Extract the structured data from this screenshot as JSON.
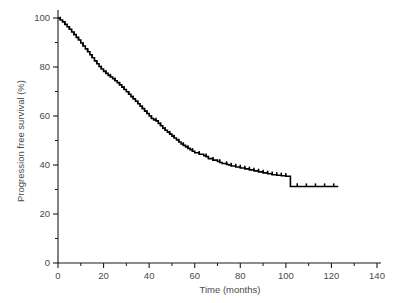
{
  "chart_data": {
    "type": "line",
    "title": "",
    "subtitle": "",
    "xlabel": "Time (months)",
    "ylabel": "Progression free survival (%)",
    "xlim": [
      0,
      140
    ],
    "ylim": [
      0,
      100
    ],
    "xticks": [
      0,
      20,
      40,
      60,
      80,
      100,
      120,
      140
    ],
    "yticks": [
      0,
      20,
      40,
      60,
      80,
      100
    ],
    "xticks_minor": [
      10,
      30,
      50,
      70,
      90,
      110,
      130
    ],
    "yticks_minor": [
      10,
      30,
      50,
      70,
      90
    ],
    "grid": false,
    "legend": "none",
    "annotations": [],
    "series": [
      {
        "name": "Progression free survival",
        "style": "kaplan-meier-step",
        "color": "#000000",
        "x": [
          0,
          1,
          2,
          3,
          4,
          5,
          6,
          7,
          8,
          9,
          10,
          11,
          12,
          13,
          14,
          15,
          16,
          17,
          18,
          19,
          20,
          21,
          22,
          23,
          24,
          25,
          26,
          27,
          28,
          29,
          30,
          31,
          32,
          33,
          34,
          35,
          36,
          37,
          38,
          39,
          40,
          41,
          42,
          43,
          44,
          45,
          46,
          47,
          48,
          49,
          50,
          51,
          52,
          53,
          54,
          55,
          56,
          57,
          58,
          59,
          60,
          62,
          64,
          65,
          66,
          68,
          70,
          71,
          72,
          74,
          75,
          76,
          78,
          80,
          82,
          84,
          86,
          88,
          90,
          92,
          94,
          96,
          98,
          100,
          102,
          104,
          108,
          112,
          116,
          120,
          123
        ],
        "y": [
          100,
          99.2,
          98.4,
          97.4,
          96.4,
          95.4,
          94.3,
          93.2,
          92.1,
          91.0,
          89.8,
          88.6,
          87.4,
          86.2,
          85.0,
          83.8,
          82.5,
          81.3,
          80.2,
          79.2,
          78.2,
          77.4,
          76.6,
          75.9,
          75.2,
          74.4,
          73.6,
          72.7,
          71.8,
          70.8,
          69.9,
          68.9,
          67.9,
          67.0,
          66.0,
          65.0,
          64.0,
          63.0,
          62.0,
          61.0,
          60.0,
          59.0,
          58.4,
          58.0,
          57.0,
          56.0,
          55.0,
          54.2,
          53.4,
          52.6,
          51.8,
          51.0,
          50.2,
          49.4,
          48.6,
          48.0,
          47.4,
          46.8,
          46.2,
          45.6,
          45.0,
          44.4,
          43.8,
          43.4,
          42.6,
          42.0,
          41.4,
          41.0,
          40.6,
          40.2,
          40.0,
          39.6,
          39.2,
          38.8,
          38.4,
          38.0,
          37.6,
          37.2,
          36.8,
          36.4,
          36.0,
          35.8,
          35.6,
          35.4,
          31.2,
          31.2,
          31.2,
          31.2,
          31.2,
          31.2,
          31.2
        ],
        "censor_times": [
          1,
          3,
          5,
          7,
          9,
          11,
          13,
          15,
          17,
          19,
          21,
          23,
          25,
          27,
          29,
          31,
          33,
          35,
          37,
          39,
          41,
          43,
          45,
          47,
          49,
          51,
          53,
          55,
          57,
          59,
          62,
          65,
          68,
          71,
          74,
          76,
          78,
          80,
          82,
          84,
          86,
          88,
          90,
          92,
          94,
          96,
          98,
          100,
          105,
          109,
          113,
          117,
          121
        ],
        "start_value": 100,
        "end_value": 31.2,
        "end_time": 123
      }
    ]
  },
  "axes": {
    "x_title": "Time (months)",
    "y_title": "Progression free survival (%)",
    "x_labels": [
      "0",
      "20",
      "40",
      "60",
      "80",
      "100",
      "120",
      "140"
    ],
    "y_labels": [
      "0",
      "20",
      "40",
      "60",
      "80",
      "100"
    ]
  },
  "colors": {
    "curve": "#000000",
    "axis": "#1a1a1a",
    "label": "#4a4a4a",
    "background": "#ffffff"
  }
}
